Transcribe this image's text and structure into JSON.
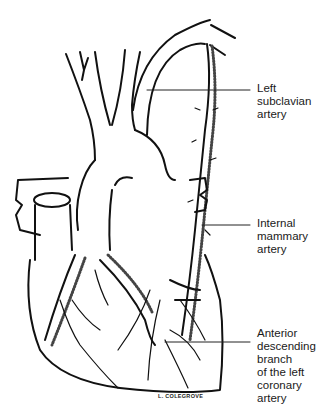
{
  "figure": {
    "labels": [
      {
        "id": "left-subclavian",
        "lines": [
          "Left",
          "subclavian",
          "artery"
        ]
      },
      {
        "id": "internal-mammary",
        "lines": [
          "Internal",
          "mammary",
          "artery"
        ]
      },
      {
        "id": "anterior-descending",
        "lines": [
          "Anterior",
          "descending",
          "branch",
          "of the left",
          "coronary",
          "artery"
        ]
      }
    ],
    "signature": "L. COLEGROVE"
  }
}
